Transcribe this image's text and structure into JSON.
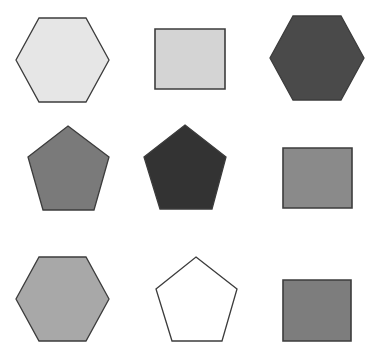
{
  "figure": {
    "width": 370,
    "height": 348,
    "background": "#ffffff",
    "stroke_color": "#3c3c3c",
    "grid": {
      "rows": 3,
      "cols": 3
    }
  },
  "shapes": [
    {
      "id": "r1c1",
      "type": "hexagon",
      "fill": "#e6e6e6",
      "points": "39,18 86,18 109,60 86,102 39,102 16,60"
    },
    {
      "id": "r1c2",
      "type": "rectangle",
      "fill": "#d4d4d4",
      "points": "155,29 225,29 225,89 155,89"
    },
    {
      "id": "r1c3",
      "type": "hexagon",
      "fill": "#4a4a4a",
      "points": "293,16 341,16 364,58 341,100 293,100 270,58"
    },
    {
      "id": "r2c1",
      "type": "pentagon",
      "fill": "#7a7a7a",
      "points": "68,126 109,157 94,210 43,210 28,157"
    },
    {
      "id": "r2c2",
      "type": "pentagon",
      "fill": "#333333",
      "points": "185,125 226,157 212,209 160,209 144,157"
    },
    {
      "id": "r2c3",
      "type": "rectangle",
      "fill": "#8a8a8a",
      "points": "283,148 352,148 352,208 283,208"
    },
    {
      "id": "r3c1",
      "type": "hexagon",
      "fill": "#a8a8a8",
      "points": "39,257 86,257 109,299 86,341 39,341 16,299"
    },
    {
      "id": "r3c2",
      "type": "pentagon",
      "fill": "#ffffff",
      "points": "196,257 237,289 222,341 172,341 156,289"
    },
    {
      "id": "r3c3",
      "type": "rectangle",
      "fill": "#7d7d7d",
      "points": "283,280 351,280 351,341 283,341"
    }
  ]
}
